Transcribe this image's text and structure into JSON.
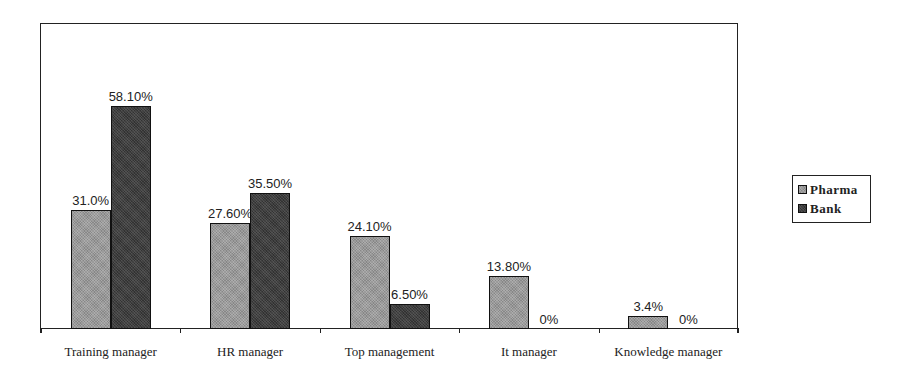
{
  "chart_data": {
    "type": "bar",
    "title": "",
    "xlabel": "",
    "ylabel": "",
    "categories": [
      "Training manager",
      "HR manager",
      "Top management",
      "It manager",
      "Knowledge manager"
    ],
    "series": [
      {
        "name": "Pharma",
        "values": [
          31.0,
          27.6,
          24.1,
          13.8,
          3.4
        ],
        "labels": [
          "31.0%",
          "27.60%",
          "24.10%",
          "13.80%",
          "3.4%"
        ],
        "color": "#9a9a9a"
      },
      {
        "name": "Bank",
        "values": [
          58.1,
          35.5,
          6.5,
          0,
          0
        ],
        "labels": [
          "58.10%",
          "35.50%",
          "6.50%",
          "0%",
          "0%"
        ],
        "color": "#3e3e3e"
      }
    ],
    "ylim": [
      0,
      75
    ],
    "grid": false,
    "legend_position": "right"
  },
  "legend": {
    "items": [
      {
        "label": "Pharma"
      },
      {
        "label": "Bank"
      }
    ]
  }
}
